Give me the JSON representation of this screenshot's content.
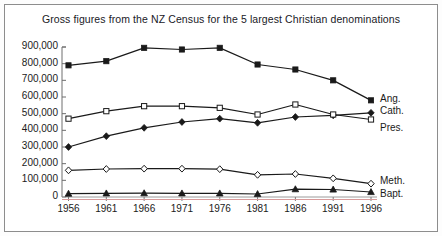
{
  "figure": {
    "title": "Gross figures from the NZ Census for the 5 largest Christian denominations",
    "border_color": "#8d8d8d",
    "background": "#ffffff"
  },
  "chart_data": {
    "type": "line",
    "title": "Gross figures from the NZ Census for the 5 largest Christian denominations",
    "xlabel": "",
    "ylabel": "",
    "categories": [
      "1956",
      "1961",
      "1966",
      "1971",
      "1976",
      "1981",
      "1986",
      "1991",
      "1996"
    ],
    "x": [
      1956,
      1961,
      1966,
      1971,
      1976,
      1981,
      1986,
      1991,
      1996
    ],
    "ylim": [
      0,
      900000
    ],
    "ytick_labels": [
      "900,000",
      "800,000",
      "700,000",
      "600,000",
      "500,000",
      "400,000",
      "300,000",
      "200,000",
      "100,000",
      "0"
    ],
    "ytick_values": [
      900000,
      800000,
      700000,
      600000,
      500000,
      400000,
      300000,
      200000,
      100000,
      0
    ],
    "grid": false,
    "legend_position": "right-inline",
    "series": [
      {
        "name": "Ang.",
        "label": "Ang.",
        "marker": "filled-square",
        "color": "#1a1a1a",
        "values": [
          790000,
          815000,
          895000,
          885000,
          895000,
          795000,
          765000,
          700000,
          580000
        ]
      },
      {
        "name": "Cath.",
        "label": "Cath.",
        "marker": "filled-diamond",
        "color": "#1a1a1a",
        "values": [
          300000,
          365000,
          415000,
          450000,
          470000,
          445000,
          480000,
          490000,
          505000
        ]
      },
      {
        "name": "Pres.",
        "label": "Pres.",
        "marker": "open-square",
        "color": "#1a1a1a",
        "values": [
          470000,
          515000,
          545000,
          545000,
          535000,
          495000,
          555000,
          495000,
          465000
        ]
      },
      {
        "name": "Meth.",
        "label": "Meth.",
        "marker": "open-diamond",
        "color": "#1a1a1a",
        "values": [
          160000,
          168000,
          170000,
          170000,
          167000,
          133000,
          138000,
          112000,
          80000
        ]
      },
      {
        "name": "Bapt.",
        "label": "Bapt.",
        "marker": "filled-triangle",
        "color": "#1a1a1a",
        "values": [
          20000,
          22000,
          23000,
          22000,
          22000,
          18000,
          47000,
          45000,
          30000
        ]
      }
    ]
  }
}
